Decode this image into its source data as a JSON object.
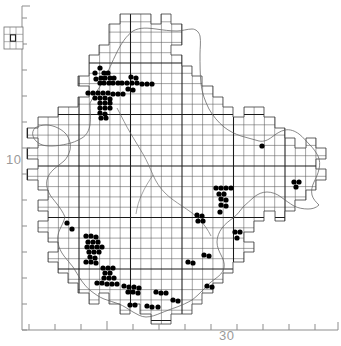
{
  "figure": {
    "type": "species-distribution-map",
    "background_color": "#ffffff",
    "ink_color": "#000000",
    "grid_color": "#4a4a4a",
    "grid_major_color": "#111111",
    "coast_color": "#555555",
    "axis_color": "#8d8d8d",
    "dot_color": "#000000"
  },
  "axes": {
    "left": {
      "label": "10",
      "label_x": 8,
      "label_y": 160,
      "tick_positions_y": [
        18,
        44,
        70,
        96,
        122,
        148,
        174,
        200,
        226,
        252,
        278,
        304,
        330
      ],
      "major_tick_index": 5,
      "line_x": 22
    },
    "bottom": {
      "label": "30",
      "label_x": 219,
      "label_y": 338,
      "tick_positions_x": [
        29,
        55,
        81,
        107,
        133,
        159,
        185,
        211,
        237,
        263,
        289,
        315
      ],
      "major_tick_index": 3,
      "line_y": 330
    }
  },
  "legend": {
    "name": "grid-reference-key",
    "x": 4,
    "y": 27,
    "width": 19,
    "height": 22,
    "cell_size": 6,
    "cols": 3,
    "rows": 3,
    "marked_cell": {
      "col": 1,
      "row": 1
    }
  },
  "grid": {
    "cell_size": 10.3,
    "origin_x": 27.5,
    "origin_y": 11.5,
    "cols": 30,
    "rows": 31,
    "major_every": 5
  },
  "chart_data": {
    "type": "scatter",
    "title": "",
    "xlabel": "",
    "ylabel": "",
    "grid": true,
    "legend_position": "top-left",
    "record_count": 118,
    "points": [
      [
        100,
        68
      ],
      [
        95,
        73
      ],
      [
        104,
        73
      ],
      [
        108,
        73
      ],
      [
        101,
        78
      ],
      [
        105,
        78
      ],
      [
        110,
        78
      ],
      [
        114,
        78
      ],
      [
        96,
        79
      ],
      [
        100,
        83
      ],
      [
        104,
        83
      ],
      [
        109,
        83
      ],
      [
        113,
        83
      ],
      [
        118,
        83
      ],
      [
        122,
        83
      ],
      [
        127,
        83
      ],
      [
        132,
        83
      ],
      [
        137,
        83
      ],
      [
        142,
        84
      ],
      [
        147,
        84
      ],
      [
        152,
        84
      ],
      [
        131,
        77
      ],
      [
        136,
        78
      ],
      [
        88,
        93
      ],
      [
        93,
        93
      ],
      [
        98,
        93
      ],
      [
        103,
        93
      ],
      [
        108,
        93
      ],
      [
        113,
        94
      ],
      [
        118,
        94
      ],
      [
        123,
        94
      ],
      [
        95,
        98
      ],
      [
        100,
        98
      ],
      [
        105,
        98
      ],
      [
        110,
        99
      ],
      [
        128,
        89
      ],
      [
        133,
        90
      ],
      [
        100,
        103
      ],
      [
        105,
        103
      ],
      [
        110,
        103
      ],
      [
        100,
        108
      ],
      [
        105,
        108
      ],
      [
        110,
        108
      ],
      [
        100,
        113
      ],
      [
        105,
        114
      ],
      [
        101,
        118
      ],
      [
        106,
        118
      ],
      [
        262,
        146
      ],
      [
        216,
        188
      ],
      [
        221,
        188
      ],
      [
        226,
        188
      ],
      [
        231,
        188
      ],
      [
        219,
        194
      ],
      [
        224,
        194
      ],
      [
        221,
        199
      ],
      [
        226,
        200
      ],
      [
        294,
        182
      ],
      [
        299,
        182
      ],
      [
        296,
        187
      ],
      [
        221,
        205
      ],
      [
        226,
        206
      ],
      [
        220,
        212
      ],
      [
        197,
        215
      ],
      [
        202,
        216
      ],
      [
        198,
        221
      ],
      [
        203,
        221
      ],
      [
        67,
        223
      ],
      [
        72,
        229
      ],
      [
        86,
        236
      ],
      [
        91,
        236
      ],
      [
        96,
        237
      ],
      [
        88,
        242
      ],
      [
        93,
        242
      ],
      [
        98,
        242
      ],
      [
        87,
        247
      ],
      [
        92,
        247
      ],
      [
        97,
        247
      ],
      [
        102,
        247
      ],
      [
        89,
        252
      ],
      [
        94,
        252
      ],
      [
        99,
        252
      ],
      [
        90,
        257
      ],
      [
        95,
        258
      ],
      [
        86,
        262
      ],
      [
        91,
        262
      ],
      [
        96,
        263
      ],
      [
        188,
        262
      ],
      [
        193,
        263
      ],
      [
        103,
        268
      ],
      [
        108,
        268
      ],
      [
        113,
        268
      ],
      [
        105,
        273
      ],
      [
        110,
        273
      ],
      [
        104,
        278
      ],
      [
        109,
        278
      ],
      [
        114,
        278
      ],
      [
        97,
        283
      ],
      [
        102,
        283
      ],
      [
        107,
        284
      ],
      [
        112,
        284
      ],
      [
        117,
        284
      ],
      [
        124,
        286
      ],
      [
        129,
        287
      ],
      [
        134,
        287
      ],
      [
        139,
        288
      ],
      [
        128,
        292
      ],
      [
        133,
        292
      ],
      [
        138,
        293
      ],
      [
        156,
        292
      ],
      [
        161,
        293
      ],
      [
        166,
        293
      ],
      [
        207,
        286
      ],
      [
        212,
        287
      ],
      [
        173,
        300
      ],
      [
        178,
        301
      ],
      [
        147,
        306
      ],
      [
        152,
        307
      ],
      [
        158,
        307
      ],
      [
        130,
        305
      ],
      [
        135,
        305
      ],
      [
        204,
        255
      ],
      [
        209,
        256
      ],
      [
        235,
        232
      ],
      [
        240,
        232
      ],
      [
        237,
        238
      ]
    ],
    "dot_radius": 2.6
  }
}
